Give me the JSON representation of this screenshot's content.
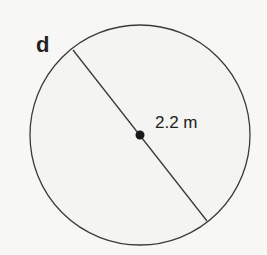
{
  "problem": {
    "part_label": "d",
    "shape": "circle",
    "segment": "diameter",
    "measurement": "2.2 m"
  },
  "colors": {
    "background": "#f7f7f6",
    "stroke": "#3a3a3a",
    "fill": "#f4f4f2",
    "text": "#222222"
  }
}
